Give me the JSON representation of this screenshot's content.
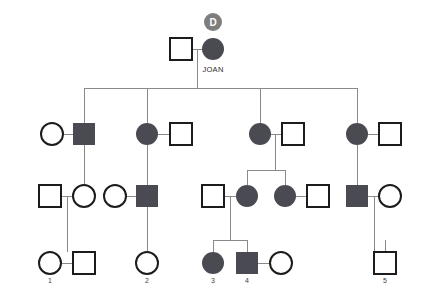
{
  "chart_data": {
    "type": "diagram",
    "colors": {
      "affected_fill": "#4a4a52",
      "unaffected_fill": "#ffffff",
      "symbol_stroke": "#1c1c1c",
      "connector_stroke": "#8a8a8a",
      "badge_fill": "#7d7d7d",
      "badge_text": "#ffffff",
      "label_text": "#3d3d3d",
      "background": "#ffffff"
    },
    "legend": {
      "filled": "affected",
      "open": "unaffected",
      "square": "male",
      "circle": "female"
    },
    "annotations": [
      {
        "id": "proband-badge",
        "text": "D",
        "x": 213,
        "y": 22,
        "r": 9
      },
      {
        "id": "joan-name",
        "text": "JOAN",
        "x": 213,
        "y": 72
      }
    ],
    "generations": [
      {
        "id": "generation-1",
        "y": 49,
        "members": [
          {
            "id": "g1-father",
            "shape": "square",
            "affected": false,
            "x": 181,
            "y": 49,
            "size": 22
          },
          {
            "id": "g1-joan",
            "shape": "circle",
            "affected": true,
            "x": 213,
            "y": 49,
            "size": 22,
            "name": "JOAN",
            "badge": "D"
          }
        ]
      },
      {
        "id": "generation-2",
        "y": 134,
        "members": [
          {
            "id": "g2-spouse-a",
            "shape": "circle",
            "affected": false,
            "x": 52,
            "y": 134,
            "size": 22
          },
          {
            "id": "g2-child-1",
            "shape": "square",
            "affected": true,
            "x": 84,
            "y": 134,
            "size": 22
          },
          {
            "id": "g2-child-2",
            "shape": "circle",
            "affected": true,
            "x": 147,
            "y": 134,
            "size": 22
          },
          {
            "id": "g2-spouse-b",
            "shape": "square",
            "affected": false,
            "x": 181,
            "y": 134,
            "size": 22
          },
          {
            "id": "g2-child-3",
            "shape": "circle",
            "affected": true,
            "x": 260,
            "y": 134,
            "size": 22
          },
          {
            "id": "g2-spouse-c",
            "shape": "square",
            "affected": false,
            "x": 293,
            "y": 134,
            "size": 22
          },
          {
            "id": "g2-child-4",
            "shape": "circle",
            "affected": true,
            "x": 357,
            "y": 134,
            "size": 22
          },
          {
            "id": "g2-spouse-d",
            "shape": "square",
            "affected": false,
            "x": 390,
            "y": 134,
            "size": 22
          }
        ]
      },
      {
        "id": "generation-3",
        "y": 196,
        "members": [
          {
            "id": "g3-spouse-a",
            "shape": "square",
            "affected": false,
            "x": 50,
            "y": 196,
            "size": 22
          },
          {
            "id": "g3-child-1",
            "shape": "circle",
            "affected": false,
            "x": 84,
            "y": 196,
            "size": 22
          },
          {
            "id": "g3-spouse-b",
            "shape": "circle",
            "affected": false,
            "x": 115,
            "y": 196,
            "size": 22
          },
          {
            "id": "g3-child-2",
            "shape": "square",
            "affected": true,
            "x": 147,
            "y": 196,
            "size": 22
          },
          {
            "id": "g3-spouse-c",
            "shape": "square",
            "affected": false,
            "x": 213,
            "y": 196,
            "size": 22
          },
          {
            "id": "g3-child-3",
            "shape": "circle",
            "affected": true,
            "x": 247,
            "y": 196,
            "size": 22
          },
          {
            "id": "g3-child-4",
            "shape": "circle",
            "affected": true,
            "x": 285,
            "y": 196,
            "size": 22
          },
          {
            "id": "g3-spouse-d",
            "shape": "square",
            "affected": false,
            "x": 318,
            "y": 196,
            "size": 22
          },
          {
            "id": "g3-child-5",
            "shape": "square",
            "affected": true,
            "x": 357,
            "y": 196,
            "size": 22
          },
          {
            "id": "g3-spouse-e",
            "shape": "circle",
            "affected": false,
            "x": 390,
            "y": 196,
            "size": 22
          }
        ]
      },
      {
        "id": "generation-4",
        "y": 263,
        "members": [
          {
            "id": "g4-person-1",
            "shape": "circle",
            "affected": false,
            "x": 50,
            "y": 263,
            "size": 22,
            "label": "1"
          },
          {
            "id": "g4-spouse-1",
            "shape": "square",
            "affected": false,
            "x": 84,
            "y": 263,
            "size": 22
          },
          {
            "id": "g4-person-2",
            "shape": "circle",
            "affected": false,
            "x": 147,
            "y": 263,
            "size": 22,
            "label": "2"
          },
          {
            "id": "g4-person-3",
            "shape": "circle",
            "affected": true,
            "x": 213,
            "y": 263,
            "size": 22,
            "label": "3"
          },
          {
            "id": "g4-person-4",
            "shape": "square",
            "affected": true,
            "x": 247,
            "y": 263,
            "size": 22,
            "label": "4"
          },
          {
            "id": "g4-spouse-4",
            "shape": "circle",
            "affected": false,
            "x": 281,
            "y": 263,
            "size": 22
          },
          {
            "id": "g4-person-5",
            "shape": "square",
            "affected": false,
            "x": 385,
            "y": 263,
            "size": 22,
            "label": "5"
          }
        ]
      }
    ],
    "labels": [
      {
        "id": "label-1",
        "text": "1",
        "x": 50,
        "y": 283
      },
      {
        "id": "label-2",
        "text": "2",
        "x": 147,
        "y": 283
      },
      {
        "id": "label-3",
        "text": "3",
        "x": 213,
        "y": 283
      },
      {
        "id": "label-4",
        "text": "4",
        "x": 247,
        "y": 283
      },
      {
        "id": "label-5",
        "text": "5",
        "x": 385,
        "y": 283
      }
    ],
    "connectors": [
      {
        "id": "mate-g1",
        "type": "mating",
        "x1": 192,
        "y1": 49,
        "x2": 202,
        "y2": 49
      },
      {
        "id": "descent-g1",
        "type": "descent",
        "x1": 197,
        "y1": 49,
        "x2": 197,
        "y2": 88
      },
      {
        "id": "sibship-g2",
        "type": "sibship",
        "x1": 84,
        "y1": 88,
        "x2": 357,
        "y2": 88
      },
      {
        "id": "drop-g2-1",
        "type": "drop",
        "x1": 84,
        "y1": 88,
        "x2": 84,
        "y2": 123
      },
      {
        "id": "drop-g2-2",
        "type": "drop",
        "x1": 147,
        "y1": 88,
        "x2": 147,
        "y2": 123
      },
      {
        "id": "drop-g2-3",
        "type": "drop",
        "x1": 260,
        "y1": 88,
        "x2": 260,
        "y2": 123
      },
      {
        "id": "drop-g2-4",
        "type": "drop",
        "x1": 357,
        "y1": 88,
        "x2": 357,
        "y2": 123
      },
      {
        "id": "mate-b1",
        "type": "mating",
        "x1": 63,
        "y1": 134,
        "x2": 73,
        "y2": 134
      },
      {
        "id": "descent-b1",
        "type": "descent",
        "x1": 84,
        "y1": 145,
        "x2": 84,
        "y2": 185
      },
      {
        "id": "mate-b2",
        "type": "mating",
        "x1": 158,
        "y1": 134,
        "x2": 170,
        "y2": 134
      },
      {
        "id": "descent-b2",
        "type": "descent",
        "x1": 147,
        "y1": 145,
        "x2": 147,
        "y2": 185
      },
      {
        "id": "mate-b3",
        "type": "mating",
        "x1": 271,
        "y1": 134,
        "x2": 282,
        "y2": 134
      },
      {
        "id": "descent-b3",
        "type": "descent",
        "x1": 275,
        "y1": 134,
        "x2": 275,
        "y2": 170
      },
      {
        "id": "sibship-b3",
        "type": "sibship",
        "x1": 247,
        "y1": 170,
        "x2": 285,
        "y2": 170
      },
      {
        "id": "drop-b3-1",
        "type": "drop",
        "x1": 247,
        "y1": 170,
        "x2": 247,
        "y2": 185
      },
      {
        "id": "drop-b3-2",
        "type": "drop",
        "x1": 285,
        "y1": 170,
        "x2": 285,
        "y2": 185
      },
      {
        "id": "mate-b4",
        "type": "mating",
        "x1": 368,
        "y1": 134,
        "x2": 379,
        "y2": 134
      },
      {
        "id": "descent-b4",
        "type": "descent",
        "x1": 357,
        "y1": 145,
        "x2": 357,
        "y2": 185
      },
      {
        "id": "mate-c1",
        "type": "mating",
        "x1": 61,
        "y1": 196,
        "x2": 73,
        "y2": 196
      },
      {
        "id": "descent-c1",
        "type": "descent",
        "x1": 67,
        "y1": 196,
        "x2": 67,
        "y2": 252
      },
      {
        "id": "mate-c2",
        "type": "mating",
        "x1": 126,
        "y1": 196,
        "x2": 136,
        "y2": 196
      },
      {
        "id": "descent-c2",
        "type": "descent",
        "x1": 147,
        "y1": 207,
        "x2": 147,
        "y2": 252
      },
      {
        "id": "mate-c3",
        "type": "mating",
        "x1": 224,
        "y1": 196,
        "x2": 236,
        "y2": 196
      },
      {
        "id": "descent-c3",
        "type": "descent",
        "x1": 230,
        "y1": 196,
        "x2": 230,
        "y2": 240
      },
      {
        "id": "sibship-c3",
        "type": "sibship",
        "x1": 213,
        "y1": 240,
        "x2": 247,
        "y2": 240
      },
      {
        "id": "drop-c3-1",
        "type": "drop",
        "x1": 213,
        "y1": 240,
        "x2": 213,
        "y2": 252
      },
      {
        "id": "drop-c3-2",
        "type": "drop",
        "x1": 247,
        "y1": 240,
        "x2": 247,
        "y2": 252
      },
      {
        "id": "mate-c4",
        "type": "mating",
        "x1": 296,
        "y1": 196,
        "x2": 307,
        "y2": 196
      },
      {
        "id": "mate-c5",
        "type": "mating",
        "x1": 368,
        "y1": 196,
        "x2": 379,
        "y2": 196
      },
      {
        "id": "descent-c5",
        "type": "descent",
        "x1": 374,
        "y1": 196,
        "x2": 374,
        "y2": 252
      },
      {
        "id": "sibship-c5",
        "type": "sibship",
        "x1": 374,
        "y1": 252,
        "x2": 385,
        "y2": 252
      },
      {
        "id": "drop-c5",
        "type": "drop",
        "x1": 385,
        "y1": 240,
        "x2": 385,
        "y2": 252
      },
      {
        "id": "mate-d1",
        "type": "mating",
        "x1": 61,
        "y1": 263,
        "x2": 73,
        "y2": 263
      },
      {
        "id": "mate-d4",
        "type": "mating",
        "x1": 258,
        "y1": 263,
        "x2": 270,
        "y2": 263
      }
    ]
  }
}
